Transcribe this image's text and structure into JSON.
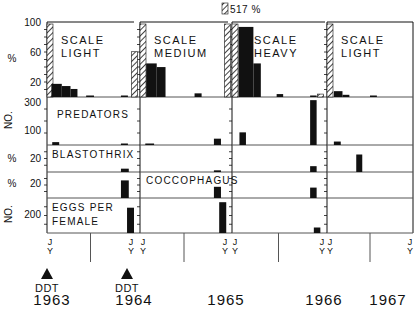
{
  "chart_data": {
    "type": "bar",
    "title": "",
    "colors": {
      "ink": "#111111",
      "background": "#ffffff",
      "line": "#555555"
    },
    "panels": [
      {
        "label_lines": [
          "SCALE",
          "LIGHT"
        ],
        "start": "J",
        "end": "J",
        "start_sub": "Y",
        "end_sub": "Y"
      },
      {
        "label_lines": [
          "SCALE",
          "MEDIUM"
        ],
        "start": "J",
        "end": "J",
        "start_sub": "Y",
        "end_sub": "Y"
      },
      {
        "label_lines": [
          "SCALE",
          "HEAVY"
        ],
        "start": "J",
        "end": "J",
        "start_sub": "Y",
        "end_sub": "Y"
      },
      {
        "label_lines": [
          "SCALE",
          "LIGHT"
        ],
        "start": "J",
        "end": "J",
        "start_sub": "Y",
        "end_sub": "Y"
      }
    ],
    "rows": [
      {
        "key": "scale",
        "ylabel": "%",
        "ticks": [
          "100",
          "60",
          "20"
        ],
        "ylim": [
          0,
          100
        ],
        "label": ""
      },
      {
        "key": "predators",
        "ylabel": "NO.",
        "ticks": [
          "300",
          "100"
        ],
        "ylim": [
          0,
          400
        ],
        "label": "PREDATORS"
      },
      {
        "key": "blastothrix",
        "ylabel": "%",
        "ticks": [
          "20"
        ],
        "ylim": [
          0,
          30
        ],
        "label": "BLASTOTHRIX"
      },
      {
        "key": "coccophagus",
        "ylabel": "%",
        "ticks": [
          "20"
        ],
        "ylim": [
          0,
          30
        ],
        "label": "COCCOPHAGUS"
      },
      {
        "key": "eggs",
        "ylabel": "NO.",
        "ticks": [
          "200"
        ],
        "ylim": [
          0,
          300
        ],
        "label_lines": [
          "EGGS PER",
          "FEMALE"
        ]
      }
    ],
    "annotation_overflow": "517 %",
    "series": [
      {
        "panel": 0,
        "row": "scale",
        "hatched": [
          {
            "x": 0.0,
            "value": 100
          },
          {
            "x": 0.97,
            "value": 62
          }
        ],
        "bars": [
          {
            "x": 0.05,
            "w": 0.12,
            "value": 18
          },
          {
            "x": 0.17,
            "w": 0.1,
            "value": 15
          },
          {
            "x": 0.27,
            "w": 0.08,
            "value": 11
          },
          {
            "x": 0.45,
            "w": 0.09,
            "value": 2
          },
          {
            "x": 0.85,
            "w": 0.08,
            "value": 1
          }
        ]
      },
      {
        "panel": 0,
        "row": "predators",
        "bars": [
          {
            "x": 0.06,
            "w": 0.08,
            "value": 25
          },
          {
            "x": 0.85,
            "w": 0.08,
            "value": 8
          }
        ]
      },
      {
        "panel": 0,
        "row": "blastothrix",
        "bars": [
          {
            "x": 0.85,
            "w": 0.09,
            "value": 4
          }
        ]
      },
      {
        "panel": 0,
        "row": "coccophagus",
        "bars": [
          {
            "x": 0.85,
            "w": 0.09,
            "value": 22
          }
        ]
      },
      {
        "panel": 0,
        "row": "eggs",
        "bars": [
          {
            "x": 0.92,
            "w": 0.08,
            "value": 230
          }
        ]
      },
      {
        "panel": 1,
        "row": "scale",
        "hatched": [
          {
            "x": 0.0,
            "value": 100
          },
          {
            "x": 0.96,
            "value": 100
          }
        ],
        "bars": [
          {
            "x": 0.07,
            "w": 0.12,
            "value": 46
          },
          {
            "x": 0.19,
            "w": 0.1,
            "value": 41
          },
          {
            "x": 0.62,
            "w": 0.08,
            "value": 5
          }
        ]
      },
      {
        "panel": 1,
        "row": "predators",
        "bars": [
          {
            "x": 0.06,
            "w": 0.1,
            "value": 10
          },
          {
            "x": 0.84,
            "w": 0.08,
            "value": 55
          }
        ]
      },
      {
        "panel": 1,
        "row": "blastothrix",
        "bars": [
          {
            "x": 0.84,
            "w": 0.08,
            "value": 2
          }
        ]
      },
      {
        "panel": 1,
        "row": "coccophagus",
        "bars": [
          {
            "x": 0.84,
            "w": 0.08,
            "value": 14
          }
        ]
      },
      {
        "panel": 1,
        "row": "eggs",
        "bars": [
          {
            "x": 0.9,
            "w": 0.08,
            "value": 280
          }
        ]
      },
      {
        "panel": 2,
        "row": "scale",
        "hatched": [
          {
            "x": 0.0,
            "value": 100
          },
          {
            "x": 0.92,
            "value": 4
          }
        ],
        "bars": [
          {
            "x": 0.07,
            "w": 0.16,
            "value": 96
          },
          {
            "x": 0.23,
            "w": 0.08,
            "value": 46
          },
          {
            "x": 0.48,
            "w": 0.07,
            "value": 4
          },
          {
            "x": 0.84,
            "w": 0.07,
            "value": 2
          }
        ]
      },
      {
        "panel": 2,
        "row": "predators",
        "bars": [
          {
            "x": 0.08,
            "w": 0.07,
            "value": 110
          },
          {
            "x": 0.84,
            "w": 0.07,
            "value": 390
          }
        ]
      },
      {
        "panel": 2,
        "row": "blastothrix",
        "bars": [
          {
            "x": 0.84,
            "w": 0.07,
            "value": 7
          }
        ]
      },
      {
        "panel": 2,
        "row": "coccophagus",
        "bars": [
          {
            "x": 0.84,
            "w": 0.07,
            "value": 13
          }
        ]
      },
      {
        "panel": 2,
        "row": "eggs",
        "bars": [
          {
            "x": 0.88,
            "w": 0.07,
            "value": 50
          }
        ]
      },
      {
        "panel": 3,
        "row": "scale",
        "hatched": [
          {
            "x": 0.0,
            "value": 100
          }
        ],
        "bars": [
          {
            "x": 0.08,
            "w": 0.1,
            "value": 8
          },
          {
            "x": 0.18,
            "w": 0.08,
            "value": 3
          },
          {
            "x": 0.5,
            "w": 0.08,
            "value": 2
          }
        ]
      },
      {
        "panel": 3,
        "row": "predators",
        "bars": [
          {
            "x": 0.08,
            "w": 0.08,
            "value": 30
          }
        ]
      },
      {
        "panel": 3,
        "row": "blastothrix",
        "bars": [
          {
            "x": 0.34,
            "w": 0.07,
            "value": 21
          }
        ]
      }
    ],
    "year_labels": [
      "1963",
      "1964",
      "1965",
      "1966",
      "1967"
    ],
    "markers": [
      {
        "label": "DDT",
        "year": "1963"
      },
      {
        "label": "DDT",
        "year": "1964"
      }
    ],
    "xlabel": "",
    "ylabel": ""
  }
}
